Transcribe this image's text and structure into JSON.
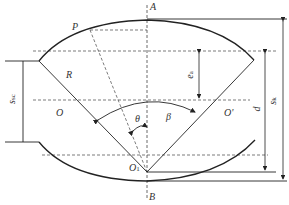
{
  "diagram": {
    "type": "geometric cross-section",
    "points": {
      "A": "A",
      "B": "B",
      "P": "P",
      "O": "O",
      "O_prime": "O'",
      "O1": "O",
      "O1_sub": "1"
    },
    "labels": {
      "R": "R",
      "theta": "θ",
      "beta": "β",
      "e_a": "e",
      "e_a_sub": "a",
      "d": "d",
      "s_k": "s",
      "s_k_sub": "k",
      "s_sc": "s",
      "s_sc_sub": "sc"
    },
    "colors": {
      "line": "#2a2a2a",
      "dashed": "#444444",
      "background": "#ffffff"
    }
  }
}
